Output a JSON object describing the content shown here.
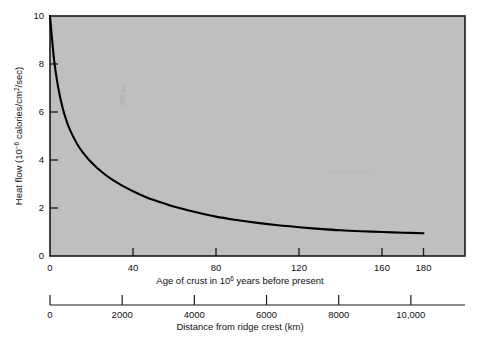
{
  "figure": {
    "background_color": "#ffffff",
    "plot_fill_color": "#bfbfbf",
    "frame_color": "#1a1a1a",
    "curve_color": "#000000"
  },
  "chart_data": {
    "type": "line",
    "title": "",
    "subtitle": "",
    "grid": false,
    "legend": null,
    "ylabel": "Heat flow (10⁻⁶ calories/cm²/sec)",
    "ylabel_parts": {
      "prefix": "Heat flow (10",
      "exponent": "−6",
      "middle": " calories/cm",
      "exponent2": "2",
      "suffix": "/sec)"
    },
    "ylim": [
      0,
      10
    ],
    "yticks": [
      0,
      2,
      4,
      6,
      8,
      10
    ],
    "ytick_labels": [
      "0",
      "2",
      "4",
      "6",
      "8",
      "10"
    ],
    "xlabel": "Age of crust in 10⁶ years before present",
    "xlabel_parts": {
      "prefix": "Age of crust in 10",
      "exponent": "6",
      "suffix": " years before present"
    },
    "xlim": [
      0,
      200
    ],
    "xticks": [
      0,
      40,
      80,
      120,
      160,
      180
    ],
    "xtick_labels": [
      "0",
      "40",
      "80",
      "120",
      "160",
      "180"
    ],
    "secondary_xlabel": "Distance from ridge crest (km)",
    "secondary_xlim": [
      0,
      11500
    ],
    "secondary_xticks": [
      0,
      2000,
      4000,
      6000,
      8000,
      10000
    ],
    "secondary_xtick_labels": [
      "0",
      "2000",
      "4000",
      "6000",
      "8000",
      "10,000"
    ],
    "series": [
      {
        "name": "Heat flow vs age of crust",
        "x": [
          0,
          2,
          4,
          6,
          8,
          10,
          13,
          16,
          20,
          25,
          30,
          35,
          40,
          45,
          50,
          60,
          70,
          80,
          90,
          100,
          110,
          120,
          130,
          140,
          150,
          160,
          170,
          180
        ],
        "y": [
          10.0,
          8.15,
          7.0,
          6.2,
          5.62,
          5.18,
          4.68,
          4.3,
          3.9,
          3.5,
          3.18,
          2.92,
          2.7,
          2.5,
          2.33,
          2.05,
          1.83,
          1.64,
          1.5,
          1.38,
          1.28,
          1.2,
          1.13,
          1.07,
          1.03,
          1.0,
          0.97,
          0.95
        ]
      }
    ],
    "annotations": []
  }
}
